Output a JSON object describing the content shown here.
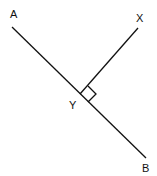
{
  "diagram": {
    "title": "",
    "points": {
      "A": {
        "label": "A",
        "x": 14,
        "y": 18
      },
      "X": {
        "label": "X",
        "x": 140,
        "y": 21
      },
      "Y": {
        "label": "Y",
        "x": 73,
        "y": 109
      },
      "B": {
        "label": "B",
        "x": 146,
        "y": 172
      }
    },
    "lines": [
      {
        "name": "AB",
        "x1": 12,
        "y1": 27,
        "x2": 146,
        "y2": 158
      },
      {
        "name": "YX",
        "x1": 80,
        "y1": 94,
        "x2": 138,
        "y2": 28
      }
    ],
    "right_angle_marker": {
      "at": "Y",
      "points": "80,94 88,86 96,94 88,102"
    },
    "colors": {
      "stroke": "#111111",
      "background": "#ffffff"
    }
  }
}
